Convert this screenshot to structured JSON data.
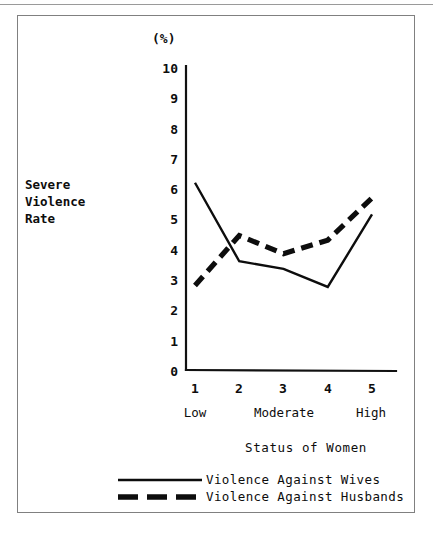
{
  "figure": {
    "unit_label": "(%)",
    "y_axis_title_lines": [
      "Severe",
      "Violence",
      "Rate"
    ],
    "x_axis_title": "Status of Women"
  },
  "legend": {
    "items": [
      {
        "label": "Violence Against Wives",
        "style": "solid",
        "color": "#0d0d0d"
      },
      {
        "label": "Violence Against Husbands",
        "style": "dashed",
        "color": "#0d0d0d"
      }
    ]
  },
  "chart_data": {
    "type": "line",
    "title": "",
    "subtitle": "",
    "xlabel": "Status of Women",
    "ylabel": "Severe Violence Rate",
    "unit": "(%)",
    "x": [
      1,
      2,
      3,
      4,
      5
    ],
    "categories": [
      "1",
      "2",
      "3",
      "4",
      "5"
    ],
    "x_tick_labels": [
      "1",
      "2",
      "3",
      "4",
      "5"
    ],
    "x_category_labels": [
      "Low",
      "Moderate",
      "High"
    ],
    "x_category_positions": [
      1,
      3,
      5
    ],
    "y_tick_labels": [
      "10",
      "9",
      "8",
      "7",
      "6",
      "5",
      "4",
      "3",
      "2",
      "1",
      "0"
    ],
    "xlim": [
      1,
      5
    ],
    "ylim": [
      0,
      10
    ],
    "grid": false,
    "legend_position": "bottom",
    "series": [
      {
        "name": "Violence Against Wives",
        "style": "solid",
        "color": "#0d0d0d",
        "values": [
          6.2,
          3.6,
          3.35,
          2.75,
          5.15
        ]
      },
      {
        "name": "Violence Against Husbands",
        "style": "dashed",
        "color": "#0d0d0d",
        "values": [
          2.8,
          4.45,
          3.85,
          4.3,
          5.7
        ]
      }
    ]
  }
}
